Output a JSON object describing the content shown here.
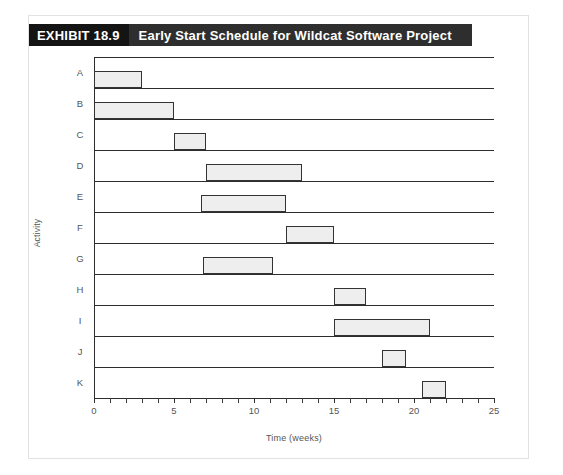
{
  "exhibit": {
    "number": "EXHIBIT 18.9",
    "title": "Early Start Schedule for Wildcat Software Project"
  },
  "colors": {
    "header_band": "#2e2e2e",
    "header_number_block": "#141414",
    "header_text": "#ffffff",
    "bar_fill": "#eeeeee",
    "bar_stroke": "#333333",
    "axis": "#2d2d2d",
    "frame": "#e2e2e2",
    "tick_text": "#555555",
    "page_background": "#ffffff"
  },
  "chart_data": {
    "type": "bar",
    "orientation": "horizontal",
    "subtype": "gantt",
    "title": "Early Start Schedule for Wildcat Software Project",
    "xlabel": "Time (weeks)",
    "ylabel": "Activity",
    "xlim": [
      0,
      25
    ],
    "ylim_categories": [
      "A",
      "B",
      "C",
      "D",
      "E",
      "F",
      "G",
      "H",
      "I",
      "J",
      "K"
    ],
    "x_major_ticks": [
      0,
      5,
      10,
      15,
      20,
      25
    ],
    "x_minor_tick_step": 1,
    "grid": "horizontal-row-separators",
    "legend": "none",
    "categories": [
      "A",
      "B",
      "C",
      "D",
      "E",
      "F",
      "G",
      "H",
      "I",
      "J",
      "K"
    ],
    "bars": [
      {
        "activity": "A",
        "start": 0,
        "end": 3,
        "duration": 3
      },
      {
        "activity": "B",
        "start": 0,
        "end": 5,
        "duration": 5
      },
      {
        "activity": "C",
        "start": 5,
        "end": 7,
        "duration": 2
      },
      {
        "activity": "D",
        "start": 7,
        "end": 13,
        "duration": 6
      },
      {
        "activity": "E",
        "start": 6.7,
        "end": 12,
        "duration": 5.3
      },
      {
        "activity": "F",
        "start": 12,
        "end": 15,
        "duration": 3
      },
      {
        "activity": "G",
        "start": 6.8,
        "end": 11.2,
        "duration": 4.4
      },
      {
        "activity": "H",
        "start": 15,
        "end": 17,
        "duration": 2
      },
      {
        "activity": "I",
        "start": 15,
        "end": 21,
        "duration": 6
      },
      {
        "activity": "J",
        "start": 18,
        "end": 19.5,
        "duration": 1.5
      },
      {
        "activity": "K",
        "start": 20.5,
        "end": 22,
        "duration": 1.5
      }
    ],
    "x_tick_labels": [
      "0",
      "5",
      "10",
      "15",
      "20",
      "25"
    ],
    "y_tick_labels": [
      "A",
      "B",
      "C",
      "D",
      "E",
      "F",
      "G",
      "H",
      "I",
      "J",
      "K"
    ]
  }
}
